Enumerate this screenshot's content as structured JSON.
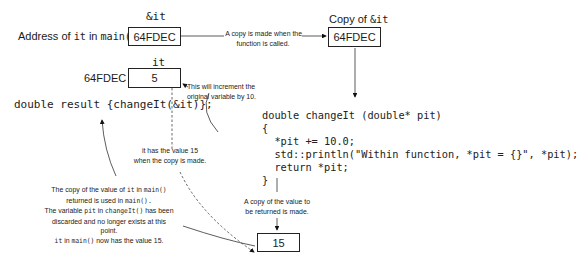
{
  "labels": {
    "amp_it_header": "&it",
    "address_label_prefix": "Address of ",
    "address_label_it": "it",
    "address_label_mid": " in ",
    "address_label_main": "main()",
    "it_header": "it",
    "it_address": "64FDEC",
    "copy_header_prefix": "Copy of ",
    "copy_header_code": "&it"
  },
  "boxes": {
    "amp_it_value": "64FDEC",
    "it_value": "5",
    "copy_value": "64FDEC",
    "return_copy_value": "15"
  },
  "notes": {
    "copy_made": [
      "A copy is made when the",
      "function is called."
    ],
    "increment": [
      "This will increment the",
      "original variable by 10."
    ],
    "has_value": [
      "it has the value 15",
      "when the copy is made."
    ],
    "return_copy": [
      "A copy of the value to",
      "be returned is made."
    ],
    "result_used": {
      "line1_a": "The copy of the value of ",
      "line1_b": "it",
      "line1_c": " in ",
      "line1_d": "main()",
      "line2_a": "returned is used in ",
      "line2_b": "main().",
      "line3_a": "The variable ",
      "line3_b": "pit",
      "line3_c": " in ",
      "line3_d": "changeIt()",
      "line3_e": " has been",
      "line4": "discarded and no longer exists at this",
      "line5": "point.",
      "line6_a": "it",
      "line6_b": " in ",
      "line6_c": "main()",
      "line6_d": " now has the value 15."
    }
  },
  "code": {
    "main_call": "double result {changeIt(&it)};",
    "function_lines": [
      "double changeIt (double* pit)",
      "{",
      "  *pit += 10.0;",
      "  std::println(\"Within function, *pit = {}\", *pit);",
      "  return *pit;",
      "}"
    ]
  }
}
